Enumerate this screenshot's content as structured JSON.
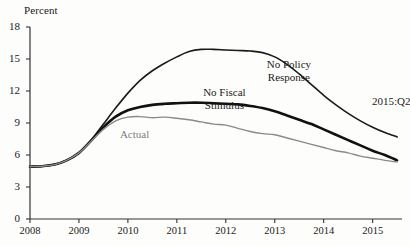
{
  "chart_data": {
    "type": "line",
    "title": "",
    "subtitle": "",
    "xlabel": "",
    "ylabel": "Percent",
    "ylim": [
      0,
      18
    ],
    "xlim": [
      2008,
      2015.6
    ],
    "yticks": [
      0,
      3,
      6,
      9,
      12,
      15,
      18
    ],
    "ytick_labels": [
      "0",
      "3",
      "6",
      "9",
      "12",
      "15",
      "18"
    ],
    "xticks": [
      2008,
      2009,
      2010,
      2011,
      2012,
      2013,
      2014,
      2015
    ],
    "xtick_labels": [
      "2008",
      "2009",
      "2010",
      "2011",
      "2012",
      "2013",
      "2014",
      "2015"
    ],
    "grid": false,
    "legend_position": "inline-annotations",
    "annotations": [
      {
        "name": "no-policy-response",
        "text_line1": "No Policy",
        "text_line2": "Response",
        "x": 2013.45,
        "y": 14.5,
        "color": "#1a1a1a"
      },
      {
        "name": "no-fiscal-stimulus",
        "text_line1": "No Fiscal",
        "text_line2": "Stimulus",
        "x": 2012.15,
        "y": 11.9,
        "color": "#1a1a1a"
      },
      {
        "name": "actual",
        "text_line1": "Actual",
        "text_line2": "",
        "x": 2010.45,
        "y": 8.0,
        "color": "#7d7d7d"
      },
      {
        "name": "period-marker",
        "text_line1": "2015:Q2",
        "text_line2": "",
        "x": 2015.15,
        "y": 11.1,
        "color": "#1a1a1a"
      }
    ],
    "series": [
      {
        "name": "No Policy Response",
        "color": "#1a1a1a",
        "width": 1.6,
        "x": [
          2008.0,
          2008.25,
          2008.5,
          2008.75,
          2009.0,
          2009.25,
          2009.5,
          2009.75,
          2010.0,
          2010.25,
          2010.5,
          2010.75,
          2011.0,
          2011.25,
          2011.5,
          2011.75,
          2012.0,
          2012.25,
          2012.5,
          2012.75,
          2013.0,
          2013.25,
          2013.5,
          2013.75,
          2014.0,
          2014.25,
          2014.5,
          2014.75,
          2015.0,
          2015.25,
          2015.5
        ],
        "values": [
          4.9,
          4.95,
          5.1,
          5.5,
          6.2,
          7.4,
          8.9,
          10.4,
          11.8,
          13.0,
          13.9,
          14.6,
          15.2,
          15.7,
          15.9,
          15.9,
          15.85,
          15.8,
          15.75,
          15.6,
          15.2,
          14.5,
          13.6,
          12.6,
          11.6,
          10.7,
          9.9,
          9.2,
          8.6,
          8.1,
          7.7
        ]
      },
      {
        "name": "No Fiscal Stimulus",
        "color": "#111111",
        "width": 2.6,
        "x": [
          2008.0,
          2008.25,
          2008.5,
          2008.75,
          2009.0,
          2009.25,
          2009.5,
          2009.75,
          2010.0,
          2010.25,
          2010.5,
          2010.75,
          2011.0,
          2011.25,
          2011.5,
          2011.75,
          2012.0,
          2012.25,
          2012.5,
          2012.75,
          2013.0,
          2013.25,
          2013.5,
          2013.75,
          2014.0,
          2014.25,
          2014.5,
          2014.75,
          2015.0,
          2015.25,
          2015.5
        ],
        "values": [
          4.9,
          4.95,
          5.1,
          5.5,
          6.2,
          7.35,
          8.6,
          9.6,
          10.2,
          10.5,
          10.7,
          10.8,
          10.85,
          10.9,
          10.9,
          10.85,
          10.8,
          10.75,
          10.6,
          10.4,
          10.1,
          9.7,
          9.3,
          8.9,
          8.4,
          7.9,
          7.4,
          6.9,
          6.4,
          6.0,
          5.5
        ]
      },
      {
        "name": "Actual",
        "color": "#8a8a8a",
        "width": 1.4,
        "x": [
          2008.0,
          2008.25,
          2008.5,
          2008.75,
          2009.0,
          2009.25,
          2009.5,
          2009.75,
          2010.0,
          2010.25,
          2010.5,
          2010.75,
          2011.0,
          2011.25,
          2011.5,
          2011.75,
          2012.0,
          2012.25,
          2012.5,
          2012.75,
          2013.0,
          2013.25,
          2013.5,
          2013.75,
          2014.0,
          2014.25,
          2014.5,
          2014.75,
          2015.0,
          2015.25,
          2015.5
        ],
        "values": [
          4.9,
          4.95,
          5.1,
          5.5,
          6.2,
          7.3,
          8.4,
          9.2,
          9.55,
          9.6,
          9.5,
          9.55,
          9.45,
          9.3,
          9.1,
          8.9,
          8.8,
          8.5,
          8.2,
          8.0,
          7.9,
          7.6,
          7.3,
          7.0,
          6.7,
          6.4,
          6.2,
          5.9,
          5.7,
          5.5,
          5.35
        ]
      }
    ]
  }
}
